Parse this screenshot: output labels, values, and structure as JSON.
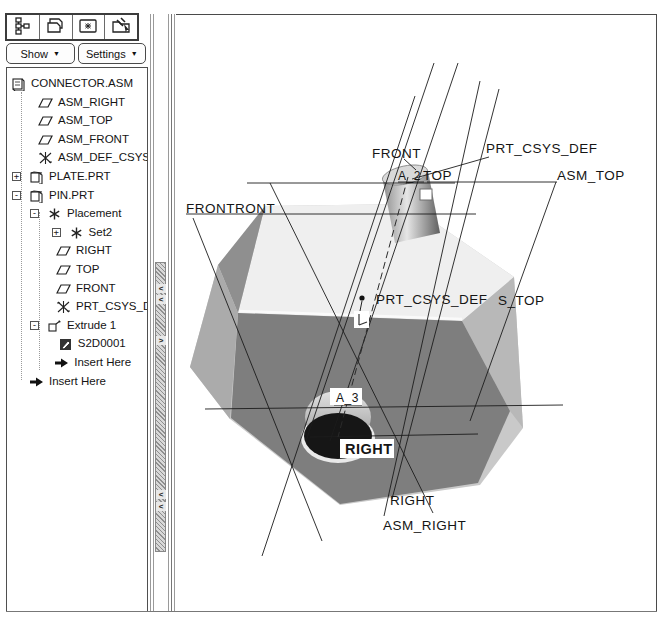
{
  "navigator": {
    "tabs": [
      {
        "icon": "model-tree-icon",
        "active": true
      },
      {
        "icon": "layer-tree-icon",
        "active": false
      },
      {
        "icon": "saved-views-icon",
        "active": false
      },
      {
        "icon": "folder-tools-icon",
        "active": false
      }
    ],
    "show_label": "Show",
    "settings_label": "Settings",
    "caret": "▼"
  },
  "tree": {
    "items": [
      {
        "label": "CONNECTOR.ASM",
        "icon": "assembly-icon",
        "box": "",
        "depth": 0
      },
      {
        "label": "ASM_RIGHT",
        "icon": "datum-plane-icon",
        "box": "",
        "depth": 1.5
      },
      {
        "label": "ASM_TOP",
        "icon": "datum-plane-icon",
        "box": "",
        "depth": 1.5
      },
      {
        "label": "ASM_FRONT",
        "icon": "datum-plane-icon",
        "box": "",
        "depth": 1.5
      },
      {
        "label": "ASM_DEF_CSYS",
        "icon": "csys-icon",
        "box": "",
        "depth": 1.5
      },
      {
        "label": "PLATE.PRT",
        "icon": "part-icon",
        "box": "+",
        "depth": 1
      },
      {
        "label": "PIN.PRT",
        "icon": "part-icon",
        "box": "-",
        "depth": 1
      },
      {
        "label": "Placement",
        "icon": "asterisk-icon",
        "box": "-",
        "depth": 2
      },
      {
        "label": "Set2",
        "icon": "asterisk-icon",
        "box": "+",
        "depth": 3.2
      },
      {
        "label": "RIGHT",
        "icon": "datum-plane-icon",
        "box": "",
        "depth": 2.5
      },
      {
        "label": "TOP",
        "icon": "datum-plane-icon",
        "box": "",
        "depth": 2.5
      },
      {
        "label": "FRONT",
        "icon": "datum-plane-icon",
        "box": "",
        "depth": 2.5
      },
      {
        "label": "PRT_CSYS_DEF",
        "icon": "csys-icon",
        "box": "",
        "depth": 2.5
      },
      {
        "label": "Extrude 1",
        "icon": "extrude-icon",
        "box": "-",
        "depth": 2
      },
      {
        "label": "S2D0001",
        "icon": "sketch-icon",
        "box": "",
        "depth": 2.6
      },
      {
        "label": "Insert Here",
        "icon": "insert-arrow-icon",
        "box": "",
        "depth": 2.4
      },
      {
        "label": "Insert Here",
        "icon": "insert-arrow-icon",
        "box": "",
        "depth": 1
      }
    ]
  },
  "viewport": {
    "labels": [
      {
        "text": "FRONTRONT",
        "x": 10,
        "y": 198,
        "size": 13.5,
        "bold": false,
        "boxed": false
      },
      {
        "text": "FRONT",
        "x": 196,
        "y": 143,
        "size": 13.5,
        "bold": false,
        "boxed": false
      },
      {
        "text": "PRT_CSYS_DEF",
        "x": 310,
        "y": 138,
        "size": 13.5,
        "bold": false,
        "boxed": false
      },
      {
        "text": "A_2",
        "x": 222,
        "y": 165,
        "size": 12,
        "bold": false,
        "boxed": false
      },
      {
        "text": "TOP",
        "x": 247,
        "y": 165,
        "size": 13.5,
        "bold": false,
        "boxed": false
      },
      {
        "text": "ASM_TOP",
        "x": 381,
        "y": 165,
        "size": 13.5,
        "bold": false,
        "boxed": false
      },
      {
        "text": "PRT_CSYS_DEF",
        "x": 200,
        "y": 289,
        "size": 13.5,
        "bold": false,
        "boxed": false
      },
      {
        "text": "S_TOP",
        "x": 322,
        "y": 290,
        "size": 13.5,
        "bold": false,
        "boxed": false
      },
      {
        "text": "A_3",
        "x": 160,
        "y": 387,
        "size": 12,
        "bold": false,
        "boxed": true,
        "bx": 154,
        "by": 373,
        "bw": 32,
        "bh": 17
      },
      {
        "text": "RIGHT",
        "x": 169,
        "y": 439,
        "size": 14.5,
        "bold": true,
        "boxed": true,
        "bx": 164,
        "by": 424,
        "bw": 54,
        "bh": 19
      },
      {
        "text": "RIGHT",
        "x": 214,
        "y": 490,
        "size": 13.5,
        "bold": false,
        "boxed": false
      },
      {
        "text": "ASM_RIGHT",
        "x": 207,
        "y": 515,
        "size": 13.5,
        "bold": false,
        "boxed": false
      }
    ],
    "axis_labels": [
      "A_2",
      "A_3"
    ],
    "model_names": [
      "CONNECTOR.ASM",
      "PLATE.PRT",
      "PIN.PRT"
    ]
  },
  "colors": {
    "face_top": "#efefef",
    "face_front_dark": "#7e7e7e",
    "face_left_upper": "#8f8f8f",
    "face_left_lower": "#ababab",
    "face_right": "#c9c9c9",
    "face_right_shade": "#b8b8b8",
    "hole_dark": "#161616",
    "line_color": "#1c1c1c",
    "panel_border": "#4a4a4a"
  }
}
